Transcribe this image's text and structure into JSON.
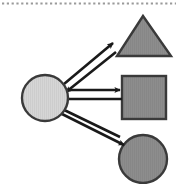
{
  "diagram": {
    "title": "Bidirectional node-shape relationship diagram",
    "canvas": {
      "width": 178,
      "height": 184,
      "background": "#ffffff"
    },
    "top_divider": {
      "name": "dotted-divider",
      "style": "dotted",
      "color": "#9a9a9a",
      "y": 3
    },
    "palette": {
      "source_fill": "#d4d4d4",
      "target_fill": "#8a8a8a",
      "outline": "#3a3a3a",
      "arrow": "#1a1a1a",
      "background": "#ffffff"
    },
    "nodes": [
      {
        "id": "source-circle",
        "shape": "circle",
        "role": "source",
        "label": "",
        "fill": "#d4d4d4",
        "stroke": "#3a3a3a",
        "cx": 45,
        "cy": 98,
        "r": 23,
        "textured": true
      },
      {
        "id": "target-triangle",
        "shape": "triangle",
        "role": "target",
        "label": "",
        "fill": "#8a8a8a",
        "stroke": "#3a3a3a",
        "apex_x": 143,
        "apex_y": 16,
        "base_y": 56,
        "base_left_x": 117,
        "base_right_x": 171
      },
      {
        "id": "target-square",
        "shape": "square",
        "role": "target",
        "label": "",
        "fill": "#8a8a8a",
        "stroke": "#3a3a3a",
        "x": 122,
        "y": 76,
        "width": 44,
        "height": 43
      },
      {
        "id": "target-circle",
        "shape": "circle",
        "role": "target",
        "label": "",
        "fill": "#8a8a8a",
        "stroke": "#3a3a3a",
        "cx": 143,
        "cy": 159,
        "r": 24,
        "clipped_edge": "bottom"
      }
    ],
    "connections": [
      {
        "id": "circle-triangle",
        "from": "source-circle",
        "to": "target-triangle",
        "type": "bidirectional",
        "label": "",
        "outbound": {
          "x1": 64,
          "y1": 84,
          "x2": 113,
          "y2": 43
        },
        "inbound": {
          "x1": 116,
          "y1": 52,
          "x2": 66,
          "y2": 92
        }
      },
      {
        "id": "circle-square",
        "from": "source-circle",
        "to": "target-square",
        "type": "bidirectional",
        "label": "",
        "outbound": {
          "x1": 56,
          "y1": 90,
          "x2": 120,
          "y2": 90
        },
        "inbound": {
          "x1": 122,
          "y1": 99,
          "x2": 55,
          "y2": 99
        }
      },
      {
        "id": "circle-bottomcircle",
        "from": "source-circle",
        "to": "target-circle",
        "type": "bidirectional",
        "label": "",
        "outbound": {
          "x1": 62,
          "y1": 114,
          "x2": 124,
          "y2": 145
        },
        "inbound": {
          "x1": 120,
          "y1": 137,
          "x2": 58,
          "y2": 107
        }
      }
    ]
  }
}
